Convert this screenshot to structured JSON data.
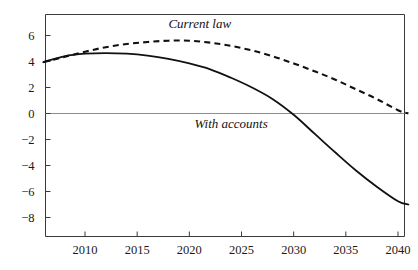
{
  "chart_data": {
    "type": "line",
    "title": "",
    "subtitle": "",
    "xlabel": "",
    "ylabel": "",
    "xlim": [
      2006,
      2041
    ],
    "ylim": [
      -9.2,
      7.0
    ],
    "grid": false,
    "legend_position": "inline-annotation",
    "x_ticks": [
      2010,
      2015,
      2020,
      2025,
      2030,
      2035,
      2040
    ],
    "x_tick_labels": [
      "2010",
      "2015",
      "2020",
      "2025",
      "2030",
      "2035",
      "2040"
    ],
    "y_ticks": [
      6,
      4,
      2,
      0,
      -2,
      -4,
      -6,
      -8
    ],
    "y_tick_labels": [
      "6",
      "4",
      "2",
      "0",
      "−2",
      "−4",
      "−6",
      "−8"
    ],
    "zero_reference_line": 0,
    "x": [
      2006,
      2008,
      2010,
      2012,
      2014,
      2016,
      2018,
      2020,
      2022,
      2024,
      2026,
      2028,
      2030,
      2032,
      2034,
      2036,
      2038,
      2040,
      2041
    ],
    "series": [
      {
        "name": "Current law",
        "style": "dashed",
        "color": "#111111",
        "label_x": 2021,
        "label_y": 6.6,
        "values": [
          3.95,
          4.35,
          4.75,
          5.1,
          5.35,
          5.5,
          5.6,
          5.6,
          5.45,
          5.2,
          4.85,
          4.4,
          3.85,
          3.25,
          2.6,
          1.85,
          1.1,
          0.25,
          0.0
        ]
      },
      {
        "name": "With accounts",
        "style": "solid",
        "color": "#111111",
        "label_x": 2024,
        "label_y": -1.1,
        "values": [
          3.95,
          4.4,
          4.6,
          4.65,
          4.6,
          4.45,
          4.2,
          3.85,
          3.4,
          2.75,
          2.0,
          1.1,
          -0.1,
          -1.55,
          -3.0,
          -4.4,
          -5.65,
          -6.75,
          -7.0
        ]
      }
    ],
    "annotations": [
      {
        "text": "Current law",
        "x": 2021,
        "y": 6.6
      },
      {
        "text": "With accounts",
        "x": 2024,
        "y": -1.1
      }
    ]
  }
}
